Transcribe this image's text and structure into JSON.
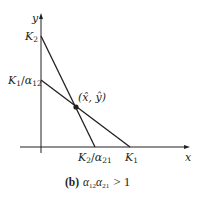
{
  "diagram": {
    "axes": {
      "x_label": "x",
      "y_label": "y"
    },
    "y_intercepts": {
      "top": {
        "base": "K",
        "sub": "2"
      },
      "lower": {
        "base": "K",
        "sub": "1",
        "slash": "/",
        "alpha": "α",
        "alpha_sub": "12"
      }
    },
    "x_intercepts": {
      "left": {
        "base": "K",
        "sub": "2",
        "slash": "/",
        "alpha": "α",
        "alpha_sub": "21"
      },
      "right": {
        "base": "K",
        "sub": "1"
      }
    },
    "equilibrium": {
      "label": "(x̂, ŷ)"
    },
    "lines": [
      {
        "name": "x-isocline",
        "from": "K1/α12",
        "to": "K1"
      },
      {
        "name": "y-isocline",
        "from": "K2",
        "to": "K2/α21"
      }
    ],
    "colors": {
      "ink": "#231f20"
    }
  },
  "caption": {
    "panel": "(b)",
    "alpha": "α",
    "sub1": "12",
    "sub2": "21",
    "relation": "> 1"
  }
}
